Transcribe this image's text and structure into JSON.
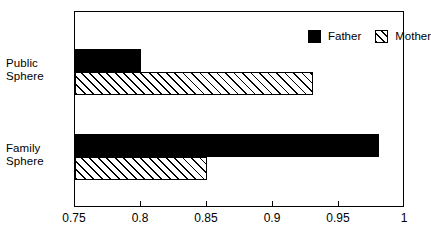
{
  "chart_data": {
    "type": "bar",
    "orientation": "horizontal",
    "title": "",
    "xlabel": "",
    "ylabel": "",
    "categories": [
      "Public Sphere",
      "Family Sphere"
    ],
    "category_lines": [
      [
        "Public",
        "Sphere"
      ],
      [
        "Family",
        "Sphere"
      ]
    ],
    "series": [
      {
        "name": "Father",
        "values": [
          0.8,
          0.98
        ],
        "fill": "solid",
        "color": "#000000"
      },
      {
        "name": "Mother",
        "values": [
          0.93,
          0.85
        ],
        "fill": "hatch",
        "color": "#ffffff"
      }
    ],
    "xlim": [
      0.75,
      1
    ],
    "xticks": [
      0.75,
      0.8,
      0.85,
      0.9,
      0.95,
      1
    ],
    "xtick_labels": [
      "0.75",
      "0.8",
      "0.85",
      "0.9",
      "0.95",
      "1"
    ],
    "grid": false,
    "legend_position": "top-right-inside",
    "frame": true,
    "background": "#ffffff",
    "axis_color": "#000000"
  },
  "legend": {
    "items": [
      {
        "label": "Father",
        "swatch": "solid-square-swatch"
      },
      {
        "label": "Mother",
        "swatch": "hatched-square-swatch"
      }
    ]
  }
}
